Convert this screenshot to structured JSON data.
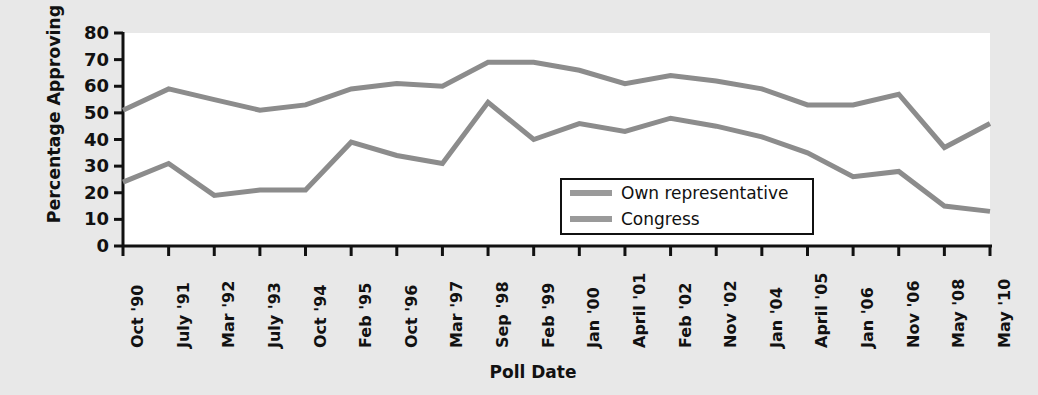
{
  "chart_data": {
    "type": "line",
    "title": "",
    "xlabel": "Poll Date",
    "ylabel": "Percentage Approving",
    "ylim": [
      0,
      80
    ],
    "ytick_step": 10,
    "yticks": [
      0,
      10,
      20,
      30,
      40,
      50,
      60,
      70,
      80
    ],
    "grid": false,
    "legend_position": "center-right-inside",
    "categories": [
      "Oct '90",
      "July '91",
      "Mar '92",
      "July '93",
      "Oct '94",
      "Feb '95",
      "Oct '96",
      "Mar '97",
      "Sep '98",
      "Feb '99",
      "Jan '00",
      "April '01",
      "Feb '02",
      "Nov '02",
      "Jan '04",
      "April '05",
      "Jan '06",
      "Nov '06",
      "May '08",
      "May '10"
    ],
    "series": [
      {
        "name": "Own representative",
        "color": "#8c8c8c",
        "values": [
          51,
          59,
          55,
          51,
          53,
          59,
          61,
          60,
          69,
          69,
          66,
          61,
          64,
          62,
          59,
          53,
          53,
          57,
          37,
          46
        ]
      },
      {
        "name": "Congress",
        "color": "#8c8c8c",
        "values": [
          24,
          31,
          19,
          21,
          21,
          39,
          34,
          31,
          54,
          40,
          46,
          43,
          48,
          45,
          41,
          35,
          26,
          28,
          15,
          13
        ]
      }
    ]
  },
  "legend": {
    "items": [
      {
        "label": "Own representative",
        "swatch_color": "#9a9a9a"
      },
      {
        "label": "Congress",
        "swatch_color": "#9a9a9a"
      }
    ]
  },
  "axes": {
    "y_title": "Percentage Approving",
    "x_title": "Poll Date",
    "y_tick_labels": [
      "80",
      "70",
      "60",
      "50",
      "40",
      "30",
      "20",
      "10",
      "0"
    ],
    "x_tick_labels": [
      "Oct '90",
      "July '91",
      "Mar '92",
      "July '93",
      "Oct '94",
      "Feb '95",
      "Oct '96",
      "Mar '97",
      "Sep '98",
      "Feb '99",
      "Jan '00",
      "April '01",
      "Feb '02",
      "Nov '02",
      "Jan '04",
      "April '05",
      "Jan '06",
      "Nov '06",
      "May '08",
      "May '10"
    ]
  },
  "colors": {
    "page_background": "#e8e8e8",
    "plot_background": "#ffffff",
    "axis": "#111111",
    "line": "#8c8c8c",
    "text": "#111111"
  }
}
